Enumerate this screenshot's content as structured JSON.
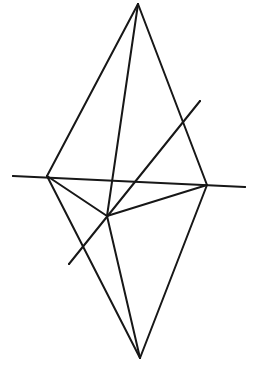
{
  "figure": {
    "kind": "line-drawing",
    "background_color": "#ffffff",
    "stroke_color": "#171717",
    "canvas": {
      "width": 253,
      "height": 368
    },
    "vertices": [
      {
        "name": "top-apex",
        "label": "top apex",
        "x": 138,
        "y": 4
      },
      {
        "name": "bottom-apex",
        "label": "bottom apex",
        "x": 140,
        "y": 358
      },
      {
        "name": "left-vertex",
        "label": "left vertex",
        "x": 47,
        "y": 176
      },
      {
        "name": "right-vertex",
        "label": "right vertex",
        "x": 207,
        "y": 185
      },
      {
        "name": "center-node",
        "label": "central node",
        "x": 107,
        "y": 216
      },
      {
        "name": "axis-left-end",
        "label": "axis left end",
        "x": 13,
        "y": 176
      },
      {
        "name": "axis-right-end",
        "label": "axis right end",
        "x": 245,
        "y": 187
      },
      {
        "name": "oblique-top-end",
        "label": "oblique upper end",
        "x": 200,
        "y": 101
      },
      {
        "name": "oblique-bot-end",
        "label": "oblique lower end",
        "x": 69,
        "y": 264
      }
    ],
    "edges": [
      {
        "name": "edge-top-apex-to-left-vertex",
        "from": "top-apex",
        "to": "left-vertex",
        "width": 2.0
      },
      {
        "name": "edge-top-apex-to-right-vertex",
        "from": "top-apex",
        "to": "right-vertex",
        "width": 2.0
      },
      {
        "name": "edge-top-apex-to-center-node",
        "from": "top-apex",
        "to": "center-node",
        "width": 2.0
      },
      {
        "name": "edge-left-vertex-to-center-node",
        "from": "left-vertex",
        "to": "center-node",
        "width": 2.0
      },
      {
        "name": "edge-right-vertex-to-center-node",
        "from": "right-vertex",
        "to": "center-node",
        "width": 2.0
      },
      {
        "name": "edge-left-vertex-to-bottom-apex",
        "from": "left-vertex",
        "to": "bottom-apex",
        "width": 2.0
      },
      {
        "name": "edge-right-vertex-to-bottom-apex",
        "from": "right-vertex",
        "to": "bottom-apex",
        "width": 2.0
      },
      {
        "name": "edge-center-node-to-bottom-apex",
        "from": "center-node",
        "to": "bottom-apex",
        "width": 2.0
      },
      {
        "name": "edge-horizontal-axis",
        "from": "axis-left-end",
        "to": "axis-right-end",
        "width": 2.0
      },
      {
        "name": "edge-oblique-diagonal",
        "from": "oblique-bot-end",
        "to": "oblique-top-end",
        "width": 2.0
      }
    ],
    "crossings": [
      {
        "name": "crossing-oblique-with-upper-right-edge",
        "x": 188,
        "y": 120
      },
      {
        "name": "crossing-oblique-with-lower-left-edge",
        "x": 81,
        "y": 253
      },
      {
        "name": "crossing-axis-with-apex-center-edge",
        "x": 128,
        "y": 180
      }
    ]
  }
}
